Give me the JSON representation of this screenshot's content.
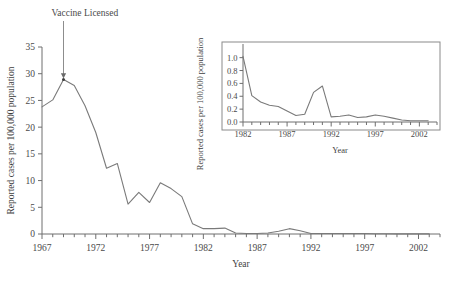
{
  "figure": {
    "background_color": "#ffffff",
    "line_color": "#7a7a7a",
    "axis_color": "#6e6e6e",
    "text_color": "#4a4a4a"
  },
  "main": {
    "xlabel": "Year",
    "ylabel": "Reported cases per 100,000 population",
    "xticks": [
      "1967",
      "1972",
      "1977",
      "1982",
      "1987",
      "1992",
      "1997",
      "2002"
    ],
    "yticks": [
      "0",
      "5",
      "10",
      "15",
      "20",
      "25",
      "30",
      "35"
    ],
    "annotation": {
      "text": "Vaccine Licensed",
      "year": 1969,
      "value": 28.9
    }
  },
  "inset": {
    "xlabel": "Year",
    "ylabel": "Reported cases per 100,000 population",
    "xticks": [
      "1982",
      "1987",
      "1992",
      "1997",
      "2002"
    ],
    "yticks": [
      "0.0",
      "0.2",
      "0.4",
      "0.6",
      "0.8",
      "1.0"
    ]
  },
  "chart_data": [
    {
      "id": "main",
      "type": "line",
      "title": "",
      "xlabel": "Year",
      "ylabel": "Reported cases per 100,000 population",
      "xlim": [
        1967,
        2004
      ],
      "ylim": [
        0,
        35
      ],
      "xticks": [
        1967,
        1972,
        1977,
        1982,
        1987,
        1992,
        1997,
        2002
      ],
      "yticks": [
        0,
        5,
        10,
        15,
        20,
        25,
        30,
        35
      ],
      "minor_tick_interval": 1,
      "grid": false,
      "legend": null,
      "annotations": [
        {
          "text": "Vaccine Licensed",
          "x": 1969,
          "y": 28.9,
          "arrow": true
        }
      ],
      "x": [
        1967,
        1968,
        1969,
        1970,
        1971,
        1972,
        1973,
        1974,
        1975,
        1976,
        1977,
        1978,
        1979,
        1980,
        1981,
        1982,
        1983,
        1984,
        1985,
        1986,
        1987,
        1988,
        1989,
        1990,
        1991,
        1992,
        1993,
        1994,
        1995,
        1996,
        1997,
        1998,
        1999,
        2000,
        2001,
        2002,
        2003
      ],
      "values": [
        23.8,
        25.1,
        28.9,
        27.8,
        24.0,
        19.0,
        12.3,
        13.2,
        5.6,
        7.8,
        5.9,
        9.6,
        8.5,
        7.0,
        1.9,
        1.0,
        1.0,
        1.1,
        0.2,
        0.1,
        0.1,
        0.2,
        0.5,
        1.0,
        0.6,
        0.1,
        0.1,
        0.1,
        0.1,
        0.1,
        0.1,
        0.05,
        0.05,
        0.02,
        0.02,
        0.02,
        0.02
      ]
    },
    {
      "id": "inset",
      "type": "line",
      "title": "",
      "xlabel": "Year",
      "ylabel": "Reported cases per 100,000 population",
      "xlim": [
        1982,
        2004
      ],
      "ylim": [
        0,
        1.15
      ],
      "xticks": [
        1982,
        1987,
        1992,
        1997,
        2002
      ],
      "yticks": [
        0.0,
        0.2,
        0.4,
        0.6,
        0.8,
        1.0
      ],
      "minor_tick_interval": 1,
      "grid": false,
      "legend": null,
      "x": [
        1982,
        1983,
        1984,
        1985,
        1986,
        1987,
        1988,
        1989,
        1990,
        1991,
        1992,
        1993,
        1994,
        1995,
        1996,
        1997,
        1998,
        1999,
        2000,
        2001,
        2002,
        2003
      ],
      "values": [
        1.02,
        0.41,
        0.31,
        0.26,
        0.24,
        0.17,
        0.1,
        0.12,
        0.46,
        0.56,
        0.08,
        0.09,
        0.11,
        0.07,
        0.08,
        0.11,
        0.09,
        0.06,
        0.03,
        0.02,
        0.02,
        0.02
      ]
    }
  ]
}
